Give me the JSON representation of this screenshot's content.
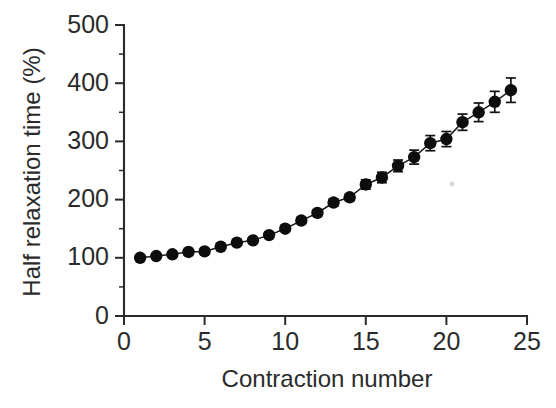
{
  "chart_data": {
    "type": "line",
    "title": "",
    "xlabel": "Contraction number",
    "ylabel": "Half relaxation time (%)",
    "xlim": [
      0,
      25
    ],
    "ylim": [
      0,
      500
    ],
    "xticks": [
      0,
      5,
      10,
      15,
      20,
      25
    ],
    "yticks": [
      0,
      100,
      200,
      300,
      400,
      500
    ],
    "xtick_labels": [
      "0",
      "5",
      "10",
      "15",
      "20",
      "25"
    ],
    "ytick_labels": [
      "0",
      "100",
      "200",
      "300",
      "400",
      "500"
    ],
    "x_minor_step": 1,
    "y_minor_step": 50,
    "grid": false,
    "legend": false,
    "marker": "filled-circle",
    "marker_color": "#0d0d0d",
    "line_color": "#1a1a1a",
    "error_bars": "vertical-capped",
    "x": [
      1,
      2,
      3,
      4,
      5,
      6,
      7,
      8,
      9,
      10,
      11,
      12,
      13,
      14,
      15,
      16,
      17,
      18,
      19,
      20,
      21,
      22,
      23,
      24
    ],
    "values": [
      100,
      103,
      106,
      110,
      111,
      119,
      126,
      130,
      139,
      150,
      164,
      177,
      195,
      204,
      226,
      238,
      258,
      273,
      297,
      304,
      333,
      350,
      368,
      388
    ],
    "errors": [
      2,
      2,
      2,
      3,
      3,
      3,
      3,
      4,
      4,
      4,
      5,
      5,
      6,
      6,
      8,
      9,
      10,
      12,
      13,
      13,
      14,
      16,
      18,
      21
    ],
    "series": [
      {
        "name": "Half relaxation time",
        "values": [
          100,
          103,
          106,
          110,
          111,
          119,
          126,
          130,
          139,
          150,
          164,
          177,
          195,
          204,
          226,
          238,
          258,
          273,
          297,
          304,
          333,
          350,
          368,
          388
        ]
      }
    ]
  },
  "axes": {
    "x_title": "Contraction number",
    "y_title": "Half relaxation time (%)"
  }
}
